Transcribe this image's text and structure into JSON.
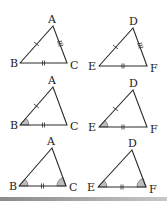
{
  "figure": {
    "colors": {
      "stroke": "#2a2a2a",
      "angle_fill": "#bdbdbd",
      "background": "#ffffff",
      "bottom_bar": "#8a8a8a"
    },
    "rows": [
      {
        "name": "sss-row",
        "left": {
          "labels": {
            "A": "A",
            "B": "B",
            "C": "C"
          },
          "vertices": {
            "A": [
              53,
              26
            ],
            "B": [
              20,
              63
            ],
            "C": [
              67,
              63
            ]
          },
          "marks": {
            "AB": 1,
            "BC": 2,
            "AC": 3
          },
          "angles": []
        },
        "right": {
          "labels": {
            "D": "D",
            "E": "E",
            "F": "F"
          },
          "vertices": {
            "D": [
              133,
              28
            ],
            "E": [
              99,
              66
            ],
            "F": [
              147,
              66
            ]
          },
          "marks": {
            "DE": 1,
            "EF": 2,
            "DF": 3
          },
          "angles": []
        }
      },
      {
        "name": "sas-row",
        "left": {
          "labels": {
            "A": "A",
            "B": "B",
            "C": "C"
          },
          "vertices": {
            "A": [
              53,
              87
            ],
            "B": [
              20,
              125
            ],
            "C": [
              67,
              125
            ]
          },
          "marks": {
            "AB": 1,
            "BC": 2
          },
          "angles": [
            "B"
          ]
        },
        "right": {
          "labels": {
            "D": "D",
            "E": "E",
            "F": "F"
          },
          "vertices": {
            "D": [
              133,
              90
            ],
            "E": [
              99,
              127
            ],
            "F": [
              147,
              127
            ]
          },
          "marks": {
            "DE": 1,
            "EF": 2
          },
          "angles": [
            "E"
          ]
        }
      },
      {
        "name": "asa-row",
        "left": {
          "labels": {
            "A": "A",
            "B": "B",
            "C": "C"
          },
          "vertices": {
            "A": [
              52,
              148
            ],
            "B": [
              19,
              186
            ],
            "C": [
              66,
              186
            ]
          },
          "marks": {
            "BC": 2
          },
          "angles": [
            "B",
            "C"
          ]
        },
        "right": {
          "labels": {
            "D": "D",
            "E": "E",
            "F": "F"
          },
          "vertices": {
            "D": [
              132,
              150
            ],
            "E": [
              98,
              187
            ],
            "F": [
              146,
              187
            ]
          },
          "marks": {
            "EF": 2
          },
          "angles": [
            "E",
            "F"
          ]
        }
      }
    ]
  }
}
